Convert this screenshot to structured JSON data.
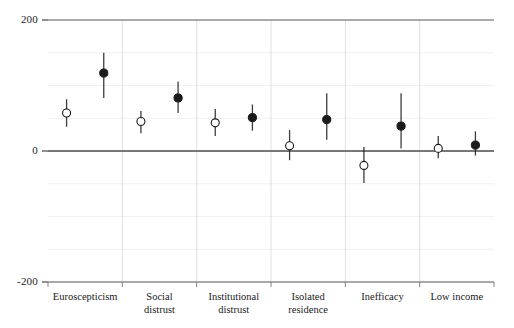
{
  "chart_data": {
    "type": "scatter",
    "title": "",
    "subtitle": "",
    "xlabel": "",
    "ylabel": "",
    "ylim": [
      -200,
      200
    ],
    "yticks": [
      200,
      0,
      -200
    ],
    "ytick_labels": [
      "200",
      "0",
      "-200"
    ],
    "minor_gridlines": [
      150,
      100,
      50,
      -50,
      -100,
      -150
    ],
    "grid": true,
    "legend_position": "none",
    "zero_line": 0,
    "categories": [
      "Euroscepticism",
      "Social\ndistrust",
      "Institutional\ndistrust",
      "Isolated\nresidence",
      "Inefficacy",
      "Low income"
    ],
    "series": [
      {
        "name": "open",
        "marker": "open-circle",
        "color": "#1a1a1a",
        "fill": "#ffffff",
        "values": [
          58,
          45,
          43,
          8,
          -22,
          4
        ],
        "ci_low": [
          37,
          27,
          23,
          -14,
          -49,
          -11
        ],
        "ci_high": [
          79,
          61,
          64,
          32,
          6,
          23
        ]
      },
      {
        "name": "filled",
        "marker": "filled-circle",
        "color": "#1a1a1a",
        "fill": "#1a1a1a",
        "values": [
          119,
          81,
          51,
          48,
          38,
          9
        ],
        "ci_low": [
          81,
          58,
          31,
          17,
          4,
          -7
        ],
        "ci_high": [
          150,
          106,
          71,
          88,
          88,
          30
        ]
      }
    ]
  },
  "axis": {
    "y_top_label": "200",
    "y_zero_label": "0",
    "y_bottom_label": "-200"
  },
  "categories_display": [
    {
      "line1": "Euroscepticism",
      "line2": ""
    },
    {
      "line1": "Social",
      "line2": "distrust"
    },
    {
      "line1": "Institutional",
      "line2": "distrust"
    },
    {
      "line1": "Isolated",
      "line2": "residence"
    },
    {
      "line1": "Inefficacy",
      "line2": ""
    },
    {
      "line1": "Low income",
      "line2": ""
    }
  ]
}
